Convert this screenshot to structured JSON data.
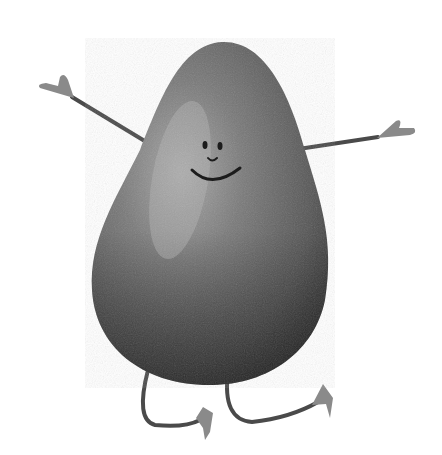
{
  "image": {
    "description": "Grayscale watercolor illustration of a smiling avocado character with stick arms and legs",
    "subject": "avocado character",
    "style": "watercolor, grayscale",
    "background_color": "#ffffff",
    "colors": {
      "body_dark": "#3a3a3a",
      "body_mid": "#6e6e6e",
      "body_highlight": "#a8a8a8",
      "limb": "#4a4a4a",
      "hand_foot": "#8a8a8a",
      "face": "#1c1c1c"
    },
    "parts": [
      "body",
      "face",
      "left-arm",
      "right-arm",
      "left-leg",
      "right-leg"
    ]
  }
}
